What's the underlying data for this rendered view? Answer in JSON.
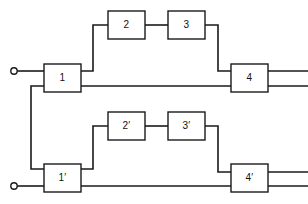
{
  "figure": {
    "type": "block-diagram",
    "title": "",
    "width": 308,
    "height": 204,
    "background_color": "#ffffff",
    "line_color": "#1a1a1a",
    "block_fill_color": "#ffffff"
  },
  "blocks": [
    {
      "id": "block-1",
      "label": "1",
      "x": 44,
      "y": 64,
      "w": 37,
      "h": 28
    },
    {
      "id": "block-2",
      "label": "2",
      "x": 108,
      "y": 11,
      "w": 37,
      "h": 28
    },
    {
      "id": "block-3",
      "label": "3",
      "x": 168,
      "y": 11,
      "w": 37,
      "h": 28
    },
    {
      "id": "block-4",
      "label": "4",
      "x": 231,
      "y": 64,
      "w": 37,
      "h": 28
    },
    {
      "id": "block-1-prime",
      "label": "1′",
      "x": 44,
      "y": 164,
      "w": 37,
      "h": 28
    },
    {
      "id": "block-2-prime",
      "label": "2′",
      "x": 108,
      "y": 112,
      "w": 37,
      "h": 28
    },
    {
      "id": "block-3-prime",
      "label": "3′",
      "x": 168,
      "y": 112,
      "w": 37,
      "h": 28
    },
    {
      "id": "block-4-prime",
      "label": "4′",
      "x": 231,
      "y": 164,
      "w": 37,
      "h": 28
    }
  ],
  "terminals": [
    {
      "id": "terminal-top-input",
      "cx": 14,
      "cy": 71,
      "r": 3.2
    },
    {
      "id": "terminal-bottom-input",
      "cx": 14,
      "cy": 186,
      "r": 3.2
    }
  ],
  "wires": [
    {
      "id": "wire-top-input-to-block-1",
      "points": "17,71 44,71"
    },
    {
      "id": "wire-block-1-to-block-2",
      "points": "81,71 93,71 93,25 108,25"
    },
    {
      "id": "wire-block-2-to-block-3",
      "points": "145,25 168,25"
    },
    {
      "id": "wire-block-3-to-block-4",
      "points": "205,25 218,25 218,71 231,71"
    },
    {
      "id": "wire-block-1-bypass-to-block-4",
      "points": "81,86 231,86"
    },
    {
      "id": "wire-block-1-cross-to-block-1-prime",
      "points": "44,86 31,86 31,169 44,169"
    },
    {
      "id": "wire-block-4-output-upper",
      "points": "268,71 308,71"
    },
    {
      "id": "wire-block-4-output-lower",
      "points": "268,86 308,86"
    },
    {
      "id": "wire-bottom-input-to-block-1-prime",
      "points": "17,186 44,186"
    },
    {
      "id": "wire-block-1-prime-to-block-2-prime",
      "points": "81,169 93,169 93,126 108,126"
    },
    {
      "id": "wire-block-2-prime-to-block-3-prime",
      "points": "145,126 168,126"
    },
    {
      "id": "wire-block-3-prime-to-block-4-prime",
      "points": "205,126 218,126 218,172 231,172"
    },
    {
      "id": "wire-block-1-prime-bypass-to-block-4-prime",
      "points": "81,186 231,186"
    },
    {
      "id": "wire-block-4-prime-output-upper",
      "points": "268,172 308,172"
    },
    {
      "id": "wire-block-4-prime-output-lower",
      "points": "268,186 308,186"
    }
  ]
}
